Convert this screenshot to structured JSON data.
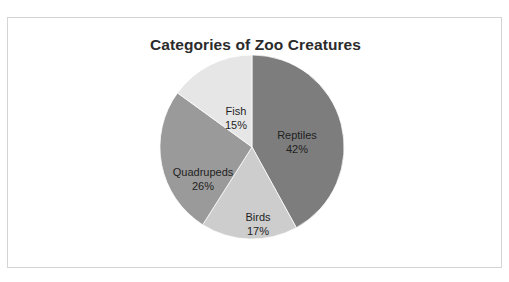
{
  "figure": {
    "title": "Categories of Zoo Creatures",
    "background_color": "#ffffff",
    "border_color": "#d4d4d4"
  },
  "chart_data": {
    "type": "pie",
    "title": "Categories of Zoo Creatures",
    "xlabel": "",
    "ylabel": "",
    "legend": false,
    "grid": false,
    "start_angle_deg": 90,
    "direction": "clockwise",
    "categories": [
      "Reptiles",
      "Birds",
      "Quadrupeds",
      "Fish"
    ],
    "values": [
      42,
      17,
      26,
      15
    ],
    "unit": "%",
    "colors": [
      "#7d7d7d",
      "#cdcdcd",
      "#9a9a9a",
      "#e6e6e6"
    ],
    "slices": [
      {
        "name": "Reptiles",
        "value": 42,
        "label_name": "Reptiles",
        "label_pct": "42%",
        "color": "#7d7d7d"
      },
      {
        "name": "Birds",
        "value": 17,
        "label_name": "Birds",
        "label_pct": "17%",
        "color": "#cdcdcd"
      },
      {
        "name": "Quadrupeds",
        "value": 26,
        "label_name": "Quadrupeds",
        "label_pct": "26%",
        "color": "#9a9a9a"
      },
      {
        "name": "Fish",
        "value": 15,
        "label_name": "Fish",
        "label_pct": "15%",
        "color": "#e6e6e6"
      }
    ]
  }
}
